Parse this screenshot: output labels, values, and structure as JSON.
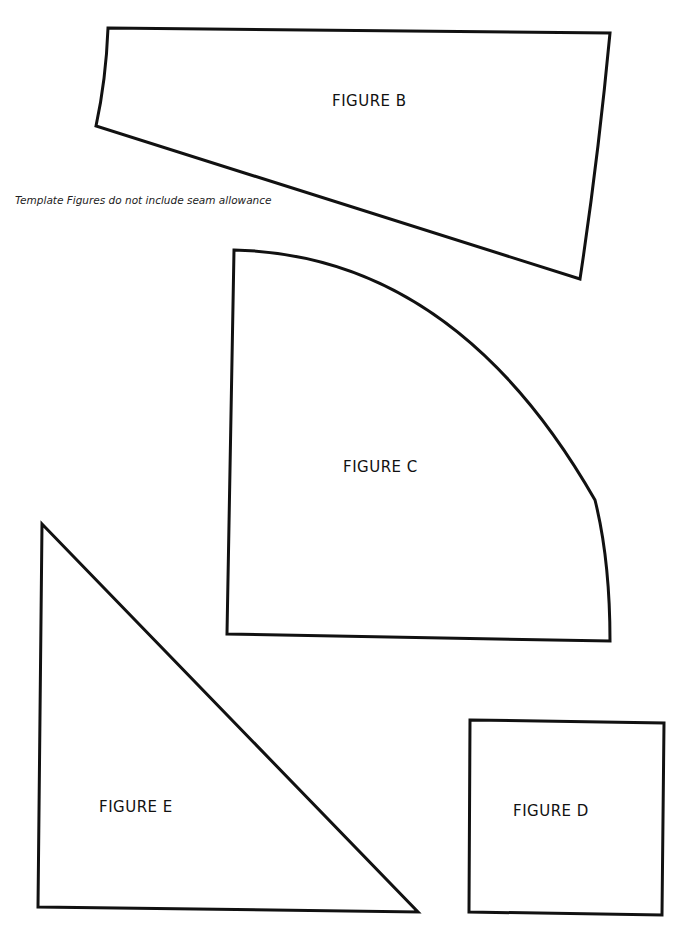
{
  "note": "Template Figures do not include seam allowance",
  "figures": {
    "b": {
      "label": "FIGURE B"
    },
    "c": {
      "label": "FIGURE C"
    },
    "d": {
      "label": "FIGURE D"
    },
    "e": {
      "label": "FIGURE E"
    }
  },
  "colors": {
    "stroke": "#111111",
    "background": "#ffffff"
  }
}
